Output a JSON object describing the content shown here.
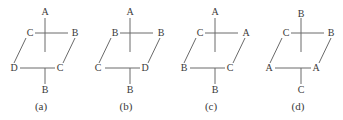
{
  "figure": {
    "panels": [
      {
        "caption": "(a)",
        "top": "A",
        "upper_left": "C",
        "upper_right": "B",
        "lower_left": "D",
        "lower_right": "C",
        "bottom": "B"
      },
      {
        "caption": "(b)",
        "top": "A",
        "upper_left": "B",
        "upper_right": "B",
        "lower_left": "C",
        "lower_right": "D",
        "bottom": "B"
      },
      {
        "caption": "(c)",
        "top": "A",
        "upper_left": "C",
        "upper_right": "A",
        "lower_left": "B",
        "lower_right": "C",
        "bottom": "B"
      },
      {
        "caption": "(d)",
        "top": "B",
        "upper_left": "C",
        "upper_right": "B",
        "lower_left": "A",
        "lower_right": "A",
        "bottom": "C"
      }
    ],
    "line_color": "#6a6a6a",
    "text_color": "#3a3a3a"
  }
}
